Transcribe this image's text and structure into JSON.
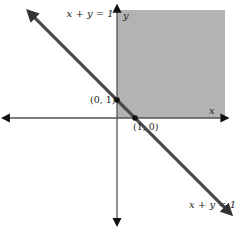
{
  "chart_data": {
    "type": "line",
    "title": "",
    "xlabel": "x",
    "ylabel": "y",
    "xlim": [
      -6.2,
      6.0
    ],
    "ylim": [
      -5.8,
      6.1
    ],
    "grid": false,
    "shaded_region": {
      "description": "first quadrant",
      "x_range": [
        0,
        6.0
      ],
      "y_range": [
        0,
        6.0
      ],
      "color": "#b3b3b3"
    },
    "series": [
      {
        "name": "x + y = 1",
        "equation": "x + y = 1",
        "x": [
          -4.8,
          6.2
        ],
        "y": [
          5.8,
          -5.2
        ],
        "color": "#4a4a4a"
      }
    ],
    "points": [
      {
        "label": "(0, 1)",
        "x": 0,
        "y": 1
      },
      {
        "label": "(1, 0)",
        "x": 1,
        "y": 0
      }
    ],
    "annotations": [
      {
        "text": "x + y = 1",
        "x": -2.8,
        "y": 5.6
      },
      {
        "text": "x + y = 1",
        "x": 4.0,
        "y": -5.0
      }
    ]
  },
  "colors": {
    "axis": "#555555",
    "line": "#4a4a4a",
    "shade": "#b3b3b3",
    "point": "#111111"
  }
}
